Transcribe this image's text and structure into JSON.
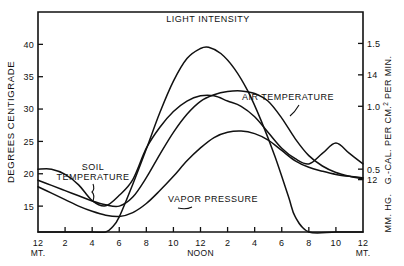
{
  "chart_data": {
    "type": "line",
    "title": "",
    "xlabel": "",
    "ylabel": "DEGREES CENTIGRADE",
    "ylabel_right_1": "G.-CAL. PER CM.2 PER MIN.",
    "ylabel_right_2": "MM. HG.",
    "grid": false,
    "legend_position": "inline-annotations",
    "x_axis": {
      "ticks": [
        {
          "label": "12",
          "sub": "MT.",
          "hour": 0
        },
        {
          "label": "2",
          "sub": "",
          "hour": 2
        },
        {
          "label": "4",
          "sub": "",
          "hour": 4
        },
        {
          "label": "6",
          "sub": "",
          "hour": 6
        },
        {
          "label": "8",
          "sub": "",
          "hour": 8
        },
        {
          "label": "10",
          "sub": "",
          "hour": 10
        },
        {
          "label": "12",
          "sub": "NOON",
          "hour": 12
        },
        {
          "label": "2",
          "sub": "",
          "hour": 14
        },
        {
          "label": "4",
          "sub": "",
          "hour": 16
        },
        {
          "label": "6",
          "sub": "",
          "hour": 18
        },
        {
          "label": "8",
          "sub": "",
          "hour": 20
        },
        {
          "label": "10",
          "sub": "",
          "hour": 22
        },
        {
          "label": "12",
          "sub": "MT.",
          "hour": 24
        }
      ],
      "range": [
        0,
        24
      ]
    },
    "y_axis_left": {
      "ticks": [
        "15",
        "20",
        "25",
        "30",
        "35",
        "40"
      ],
      "tick_values": [
        15,
        20,
        25,
        30,
        35,
        40
      ],
      "range": [
        11,
        45
      ]
    },
    "y_axis_right_gcal": {
      "ticks": [
        "0.5",
        "1.0",
        "1.5"
      ],
      "tick_values": [
        0.5,
        1.0,
        1.5
      ],
      "range": [
        0,
        1.75
      ]
    },
    "y_axis_right_mmhg": {
      "ticks": [
        "12",
        "14"
      ],
      "tick_values": [
        12,
        14
      ],
      "range": [
        11,
        15.2
      ]
    },
    "series": [
      {
        "name": "LIGHT INTENSITY",
        "axis": "right-gcal",
        "x": [
          0,
          2,
          4,
          5,
          5.5,
          6,
          7,
          8,
          9,
          10,
          11,
          12,
          12.6,
          13.5,
          14.5,
          15.5,
          16.5,
          17.5,
          18.5,
          19,
          20,
          22,
          24
        ],
        "values": [
          0,
          0,
          0,
          0,
          0.04,
          0.12,
          0.38,
          0.66,
          0.95,
          1.2,
          1.38,
          1.46,
          1.47,
          1.42,
          1.3,
          1.12,
          0.88,
          0.6,
          0.28,
          0.12,
          0,
          0,
          0
        ]
      },
      {
        "name": "AIR TEMPERATURE",
        "axis": "left",
        "x": [
          0,
          1,
          2,
          3,
          4,
          5,
          6,
          7,
          8,
          9,
          10,
          11,
          12,
          13,
          14,
          15,
          16,
          17,
          18,
          19,
          20,
          21,
          22,
          23,
          24
        ],
        "values": [
          19.0,
          18.2,
          17.4,
          16.6,
          15.8,
          15.2,
          15.0,
          16.4,
          19.4,
          23.0,
          26.4,
          29.2,
          31.2,
          32.2,
          32.7,
          32.8,
          32.4,
          31.2,
          28.6,
          25.4,
          22.8,
          21.2,
          20.2,
          19.6,
          19.2
        ]
      },
      {
        "name": "SOIL TEMPERATURE",
        "axis": "left",
        "x": [
          0,
          1,
          2,
          3,
          4,
          5,
          6,
          7,
          8,
          9,
          10,
          11,
          12,
          13,
          14,
          15,
          16,
          17,
          18,
          19,
          20,
          21,
          22,
          23,
          24
        ],
        "values": [
          18.0,
          17.0,
          16.0,
          15.0,
          14.2,
          13.6,
          13.4,
          14.0,
          15.4,
          17.4,
          19.6,
          22.0,
          24.0,
          25.6,
          26.4,
          26.6,
          26.2,
          25.2,
          23.6,
          22.0,
          21.0,
          20.4,
          19.9,
          19.6,
          19.4
        ]
      },
      {
        "name": "VAPOR PRESSURE",
        "axis": "right-mmhg",
        "x": [
          0,
          1,
          2,
          3,
          4,
          5,
          6,
          7,
          8,
          9,
          10,
          11,
          12,
          13,
          14,
          15,
          16,
          17,
          18,
          19,
          20,
          21,
          22,
          23,
          24
        ],
        "values": [
          12.2,
          12.2,
          12.1,
          11.9,
          11.6,
          11.5,
          11.7,
          12.0,
          12.6,
          13.0,
          13.3,
          13.5,
          13.6,
          13.6,
          13.5,
          13.4,
          13.2,
          12.9,
          12.6,
          12.4,
          12.3,
          12.5,
          12.7,
          12.5,
          12.3
        ]
      }
    ],
    "annotations": [
      {
        "text": "LIGHT INTENSITY",
        "x": 208,
        "y": 22
      },
      {
        "text": "AIR TEMPERATURE",
        "x": 288,
        "y": 100
      },
      {
        "text": "SOIL TEMPERATURE",
        "x": 93,
        "y": 179
      },
      {
        "text": "VAPOR PRESSURE",
        "x": 213,
        "y": 202
      }
    ]
  },
  "axis_titles": {
    "left": "DEGREES CENTIGRADE",
    "right_upper": "G.-CAL. PER CM.",
    "right_upper_sup": "2",
    "right_upper_tail": " PER MIN.",
    "right_lower": "MM. HG."
  },
  "annotation_labels": {
    "light": "LIGHT INTENSITY",
    "air": "AIR TEMPERATURE",
    "soil_line1": "SOIL",
    "soil_line2": "TEMPERATURE",
    "vapor": "VAPOR PRESSURE"
  }
}
